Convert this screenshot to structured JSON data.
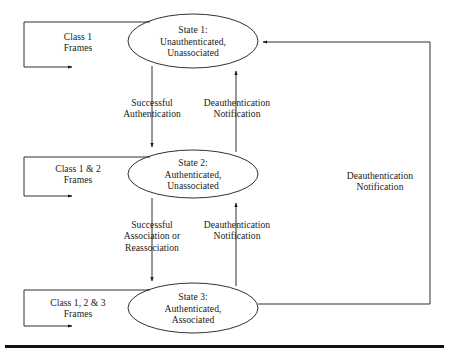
{
  "diagram": {
    "colors": {
      "background": "#ffffff",
      "stroke": "#1a1a1a",
      "text": "#1a1a1a",
      "rule": "#111111"
    },
    "states": [
      {
        "id": "state-1",
        "line1": "State 1:",
        "line2": "Unauthenticated,",
        "line3": "Unassociated"
      },
      {
        "id": "state-2",
        "line1": "State 2:",
        "line2": "Authenticated,",
        "line3": "Unassociated"
      },
      {
        "id": "state-3",
        "line1": "State 3:",
        "line2": "Authenticated,",
        "line3": "Associated"
      }
    ],
    "class_loops": [
      {
        "id": "class-loop-1",
        "line1": "Class 1",
        "line2": "Frames"
      },
      {
        "id": "class-loop-2",
        "line1": "Class 1 & 2",
        "line2": "Frames"
      },
      {
        "id": "class-loop-3",
        "line1": "Class 1, 2 & 3",
        "line2": "Frames"
      }
    ],
    "transitions": [
      {
        "id": "successful-authentication",
        "line1": "Successful",
        "line2": "Authentication",
        "line3": "",
        "direction": "state-1-to-state-2"
      },
      {
        "id": "deauthentication-notification-upper",
        "line1": "Deauthentication",
        "line2": "Notification",
        "line3": "",
        "direction": "state-2-to-state-1"
      },
      {
        "id": "successful-association-or-reassociation",
        "line1": "Successful",
        "line2": "Association or",
        "line3": "Reassociation",
        "direction": "state-2-to-state-3"
      },
      {
        "id": "deauthentication-notification-lower",
        "line1": "Deauthentication",
        "line2": "Notification",
        "line3": "",
        "direction": "state-3-to-state-2"
      },
      {
        "id": "deauthentication-notification-right",
        "line1": "Deauthentication",
        "line2": "Notification",
        "line3": "",
        "direction": "state-3-to-state-1"
      }
    ]
  }
}
